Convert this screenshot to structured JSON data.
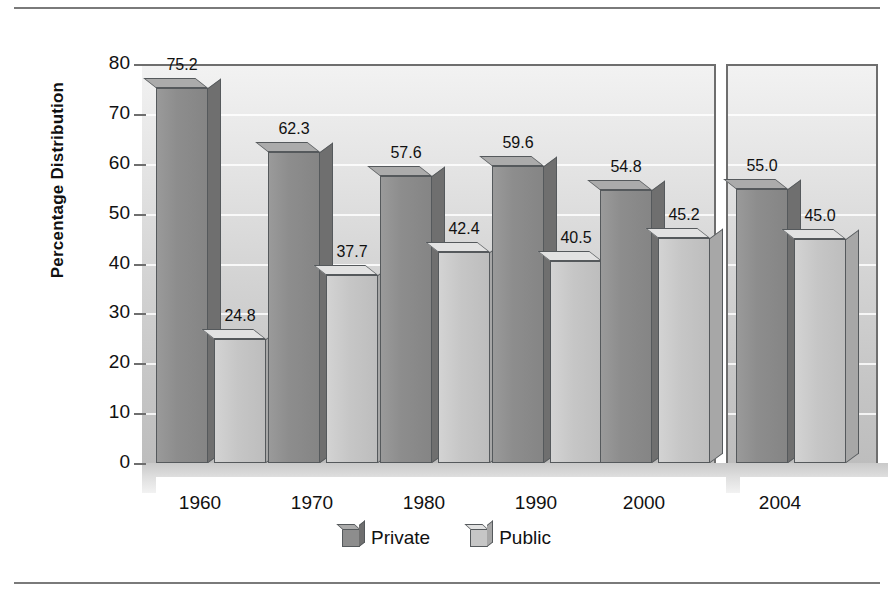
{
  "chart_data": {
    "type": "bar",
    "title": "",
    "subtitle": "",
    "xlabel": "",
    "ylabel": "Percentage Distribution",
    "categories": [
      "1960",
      "1970",
      "1980",
      "1990",
      "2000",
      "2004"
    ],
    "series": [
      {
        "name": "Private",
        "color": "#8d8d8d",
        "values": [
          75.2,
          62.3,
          57.6,
          59.6,
          54.8,
          55.0
        ]
      },
      {
        "name": "Public",
        "color": "#c6c6c6",
        "values": [
          24.8,
          37.7,
          42.4,
          40.5,
          45.2,
          45.0
        ]
      }
    ],
    "value_labels": [
      "75.2",
      "24.8",
      "62.3",
      "37.7",
      "57.6",
      "42.4",
      "59.6",
      "40.5",
      "54.8",
      "45.2",
      "55.0",
      "45.0"
    ],
    "ylim": [
      0,
      80
    ],
    "y_ticks": [
      "80",
      "70",
      "60",
      "50",
      "40",
      "30",
      "20",
      "10",
      "0"
    ],
    "grid": true,
    "legend_position": "bottom-center",
    "axis_break_after_category": "2000",
    "style_note": "3D beveled bars, grayscale"
  },
  "legend": {
    "items": [
      {
        "label": "Private",
        "swatch": "dark-gray-cube"
      },
      {
        "label": "Public",
        "swatch": "light-gray-cube"
      }
    ]
  },
  "colors": {
    "private_face": "#8d8d8d",
    "public_face": "#c6c6c6",
    "axis": "#6e6e6e",
    "gridline": "#ffffff",
    "rule": "#7a7a7a",
    "background": "#ffffff"
  }
}
